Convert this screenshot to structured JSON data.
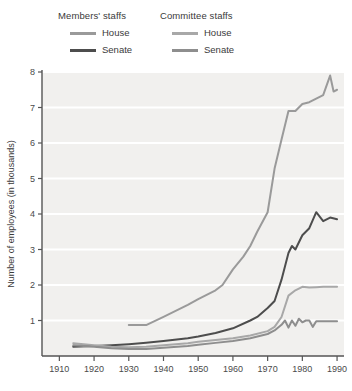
{
  "legend": {
    "groups": [
      {
        "title": "Members' staffs",
        "entries": [
          {
            "label": "House",
            "color": "#9a9a9a"
          },
          {
            "label": "Senate",
            "color": "#4d4d4d"
          }
        ]
      },
      {
        "title": "Committee staffs",
        "entries": [
          {
            "label": "House",
            "color": "#a8a8a8"
          },
          {
            "label": "Senate",
            "color": "#8e8e8e"
          }
        ]
      }
    ]
  },
  "axes": {
    "y_title": "Number of employees (in thousands)",
    "y_ticks": [
      "1",
      "2",
      "3",
      "4",
      "5",
      "6",
      "7",
      "8"
    ],
    "x_ticks": [
      "1910",
      "1920",
      "1930",
      "1940",
      "1950",
      "1960",
      "1970",
      "1980",
      "1990"
    ]
  },
  "style": {
    "plot_background": "#f1f0ee",
    "gridline_color": "#ffffff",
    "axis_color": "#555555",
    "page_background": "#ffffff"
  },
  "chart_data": {
    "type": "line",
    "title": "",
    "xlabel": "",
    "ylabel": "Number of employees (in thousands)",
    "xlim": [
      1905,
      1992
    ],
    "ylim": [
      0,
      8
    ],
    "grid": true,
    "legend_position": "top",
    "value_units": "thousands of employees",
    "series": [
      {
        "name": "Members' staffs — House",
        "group": "Members' staffs",
        "chamber": "House",
        "color": "#9a9a9a",
        "x": [
          1930,
          1935,
          1940,
          1947,
          1950,
          1955,
          1957,
          1960,
          1963,
          1965,
          1967,
          1970,
          1972,
          1974,
          1976,
          1978,
          1980,
          1982,
          1984,
          1986,
          1988,
          1989,
          1990
        ],
        "y": [
          0.87,
          0.87,
          1.1,
          1.44,
          1.6,
          1.85,
          2.0,
          2.44,
          2.8,
          3.1,
          3.5,
          4.05,
          5.28,
          6.1,
          6.9,
          6.9,
          7.1,
          7.15,
          7.25,
          7.35,
          7.9,
          7.45,
          7.5
        ]
      },
      {
        "name": "Members' staffs — Senate",
        "group": "Members' staffs",
        "chamber": "Senate",
        "color": "#4d4d4d",
        "x": [
          1914,
          1920,
          1925,
          1930,
          1935,
          1940,
          1947,
          1950,
          1955,
          1960,
          1965,
          1967,
          1970,
          1972,
          1974,
          1976,
          1977,
          1978,
          1980,
          1982,
          1984,
          1986,
          1988,
          1990
        ],
        "y": [
          0.26,
          0.28,
          0.3,
          0.33,
          0.37,
          0.42,
          0.5,
          0.55,
          0.65,
          0.78,
          1.0,
          1.1,
          1.35,
          1.55,
          2.15,
          2.9,
          3.1,
          3.0,
          3.4,
          3.6,
          4.05,
          3.8,
          3.9,
          3.85
        ]
      },
      {
        "name": "Committee staffs — House",
        "group": "Committee staffs",
        "chamber": "House",
        "color": "#a8a8a8",
        "x": [
          1914,
          1920,
          1925,
          1930,
          1935,
          1940,
          1947,
          1950,
          1955,
          1960,
          1965,
          1970,
          1972,
          1974,
          1976,
          1978,
          1980,
          1982,
          1984,
          1986,
          1988,
          1990
        ],
        "y": [
          0.36,
          0.3,
          0.26,
          0.25,
          0.26,
          0.3,
          0.36,
          0.4,
          0.45,
          0.5,
          0.58,
          0.7,
          0.82,
          1.1,
          1.7,
          1.85,
          1.95,
          1.93,
          1.94,
          1.95,
          1.95,
          1.95
        ]
      },
      {
        "name": "Committee staffs — Senate",
        "group": "Committee staffs",
        "chamber": "Senate",
        "color": "#8e8e8e",
        "x": [
          1914,
          1920,
          1925,
          1930,
          1935,
          1940,
          1947,
          1950,
          1955,
          1960,
          1965,
          1970,
          1972,
          1974,
          1975,
          1976,
          1977,
          1978,
          1979,
          1980,
          1981,
          1982,
          1983,
          1984,
          1986,
          1988,
          1990
        ],
        "y": [
          0.3,
          0.26,
          0.22,
          0.2,
          0.2,
          0.23,
          0.28,
          0.32,
          0.37,
          0.42,
          0.5,
          0.62,
          0.72,
          0.88,
          1.0,
          0.8,
          1.0,
          0.85,
          1.05,
          0.95,
          1.0,
          1.0,
          0.82,
          0.98,
          0.98,
          0.98,
          0.98
        ]
      }
    ]
  }
}
